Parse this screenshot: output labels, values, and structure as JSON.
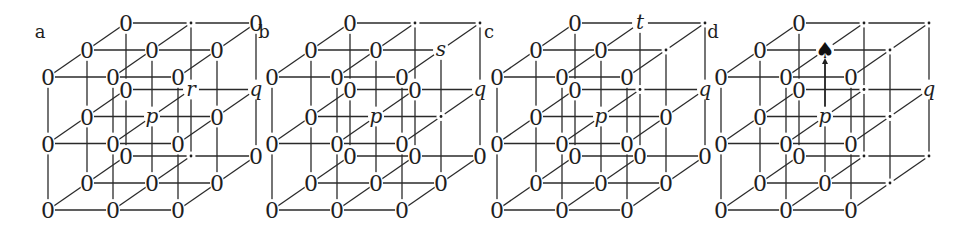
{
  "figure": {
    "geometry": {
      "col_dx": 65,
      "row_dy": 66.5,
      "depth_dx": 39,
      "depth_dy": 27,
      "base_y": 210,
      "label_dx": -8,
      "label_y": 38
    },
    "legend_note": "Grid index: layers[depth][row from top][column]. depth 0 = front, 2 = back.",
    "panels": [
      {
        "label": "a",
        "x0": 48,
        "layers": [
          [
            [
              "0",
              "0",
              "0"
            ],
            [
              "0",
              "0",
              "0"
            ],
            [
              "0",
              "0",
              "0"
            ]
          ],
          [
            [
              "0",
              "0",
              "0"
            ],
            [
              "0",
              "p",
              "0"
            ],
            [
              "0",
              "0",
              "0"
            ]
          ],
          [
            [
              "0",
              "·",
              "0"
            ],
            [
              "0",
              "r",
              "q"
            ],
            [
              "0",
              "·",
              "0"
            ]
          ]
        ]
      },
      {
        "label": "b",
        "x0": 272,
        "layers": [
          [
            [
              "0",
              "0",
              "0"
            ],
            [
              "0",
              "0",
              "0"
            ],
            [
              "0",
              "0",
              "0"
            ]
          ],
          [
            [
              "0",
              "0",
              "s"
            ],
            [
              "0",
              "p",
              "·"
            ],
            [
              "0",
              "0",
              "0"
            ]
          ],
          [
            [
              "0",
              "·",
              "·"
            ],
            [
              "0",
              "0",
              "q"
            ],
            [
              "0",
              "0",
              "0"
            ]
          ]
        ]
      },
      {
        "label": "c",
        "x0": 497,
        "layers": [
          [
            [
              "0",
              "0",
              "0"
            ],
            [
              "0",
              "0",
              "0"
            ],
            [
              "0",
              "0",
              "0"
            ]
          ],
          [
            [
              "0",
              "0",
              "·"
            ],
            [
              "0",
              "p",
              "0"
            ],
            [
              "0",
              "0",
              "0"
            ]
          ],
          [
            [
              "0",
              "t",
              "·"
            ],
            [
              "0",
              "·",
              "q"
            ],
            [
              "0",
              "0",
              "0"
            ]
          ]
        ]
      },
      {
        "label": "d",
        "x0": 721,
        "layers": [
          [
            [
              "0",
              "0",
              "0"
            ],
            [
              "0",
              "0",
              "0"
            ],
            [
              "0",
              "0",
              "0"
            ]
          ],
          [
            [
              "0",
              "♠",
              "·"
            ],
            [
              "0",
              "p",
              "·"
            ],
            [
              "0",
              "0",
              "·"
            ]
          ],
          [
            [
              "0",
              "·",
              "·"
            ],
            [
              "0",
              "·",
              "q"
            ],
            [
              "0",
              "·",
              "·"
            ]
          ]
        ]
      }
    ],
    "arrow": {
      "panel": "d",
      "from": "p",
      "to": "♠",
      "description": "Vertical arrow from site p up to the spade site in panel d"
    }
  }
}
